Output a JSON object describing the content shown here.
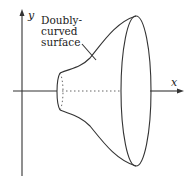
{
  "diagram": {
    "axes": {
      "x_label": "x",
      "y_label": "y"
    },
    "annotation": {
      "lines": [
        "Doubly-",
        "curved",
        "surface"
      ]
    },
    "colors": {
      "stroke": "#333333",
      "background": "#ffffff"
    }
  }
}
